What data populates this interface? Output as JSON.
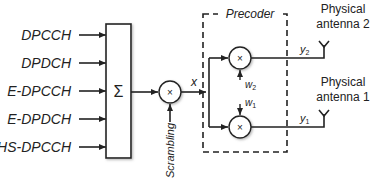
{
  "diagram": {
    "inputs": [
      "DPCCH",
      "DPDCH",
      "E-DPCCH",
      "E-DPDCH",
      "HS-DPCCH"
    ],
    "summer": {
      "symbol": "Σ"
    },
    "scrambler": {
      "symbol": "×",
      "input_label": "Scrambling",
      "output_label": "x"
    },
    "precoder": {
      "title": "Precoder",
      "multipliers": [
        {
          "symbol": "×",
          "weight": "w",
          "weight_sub": "2",
          "output": "y",
          "output_sub": "2"
        },
        {
          "symbol": "×",
          "weight": "w",
          "weight_sub": "1",
          "output": "y",
          "output_sub": "1"
        }
      ]
    },
    "antennas": [
      {
        "line1": "Physical",
        "line2": "antenna 2"
      },
      {
        "line1": "Physical",
        "line2": "antenna 1"
      }
    ]
  }
}
